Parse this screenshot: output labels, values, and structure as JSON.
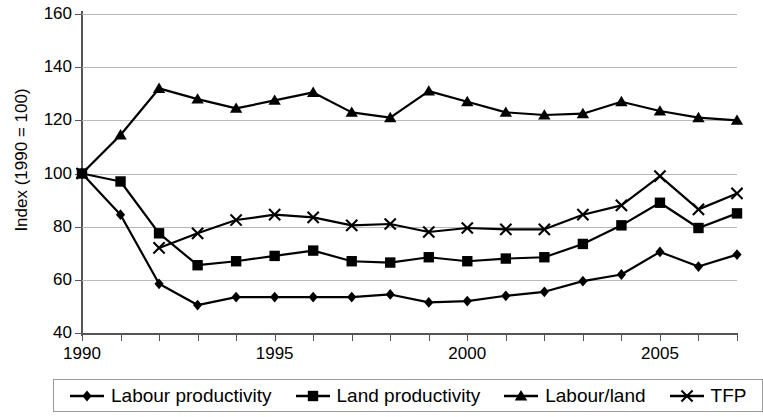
{
  "chart_data": {
    "type": "line",
    "title": "",
    "xlabel": "",
    "ylabel": "Index (1990 = 100)",
    "xlim": [
      1990,
      2007
    ],
    "ylim": [
      40,
      160
    ],
    "yticks": [
      40,
      60,
      80,
      100,
      120,
      140,
      160
    ],
    "xticks": [
      1990,
      1995,
      2000,
      2005
    ],
    "xtick_labels": [
      "1990",
      "1995",
      "2000",
      "2005"
    ],
    "grid": "horizontal",
    "legend_position": "bottom",
    "x": [
      1990,
      1991,
      1992,
      1993,
      1994,
      1995,
      1996,
      1997,
      1998,
      1999,
      2000,
      2001,
      2002,
      2003,
      2004,
      2005,
      2006,
      2007
    ],
    "series": [
      {
        "name": "Labour productivity",
        "marker": "diamond",
        "color": "#000000",
        "values": [
          100,
          84.5,
          58.5,
          50.5,
          53.5,
          53.5,
          53.5,
          53.5,
          54.5,
          51.5,
          52,
          54,
          55.5,
          59.5,
          62,
          70.5,
          65,
          69.5
        ]
      },
      {
        "name": "Land productivity",
        "marker": "square",
        "color": "#000000",
        "values": [
          100,
          97,
          77.5,
          65.5,
          67,
          69,
          71,
          67,
          66.5,
          68.5,
          67,
          68,
          68.5,
          73.5,
          80.5,
          89,
          79.5,
          85
        ]
      },
      {
        "name": "Labour/land",
        "marker": "triangle",
        "color": "#000000",
        "values": [
          100,
          114.5,
          132,
          128,
          124.5,
          127.5,
          130.5,
          123,
          121,
          131,
          127,
          123,
          122,
          122.5,
          127,
          123.5,
          121,
          120
        ]
      },
      {
        "name": "TFP",
        "marker": "cross",
        "color": "#000000",
        "values": [
          100,
          null,
          72,
          77.5,
          82.5,
          84.5,
          83.5,
          80.5,
          81,
          78,
          79.5,
          79,
          79,
          84.5,
          88,
          99,
          86.5,
          92.5
        ]
      }
    ]
  },
  "axes": {
    "y_title": "Index (1990 = 100)",
    "y_labels": [
      "160",
      "140",
      "120",
      "100",
      "80",
      "60",
      "40"
    ],
    "x_labels": [
      "1990",
      "1995",
      "2000",
      "2005"
    ]
  },
  "legend": {
    "entries": [
      {
        "label": "Labour productivity",
        "marker": "diamond"
      },
      {
        "label": "Land productivity",
        "marker": "square"
      },
      {
        "label": "Labour/land",
        "marker": "triangle"
      },
      {
        "label": "TFP",
        "marker": "cross"
      }
    ]
  }
}
